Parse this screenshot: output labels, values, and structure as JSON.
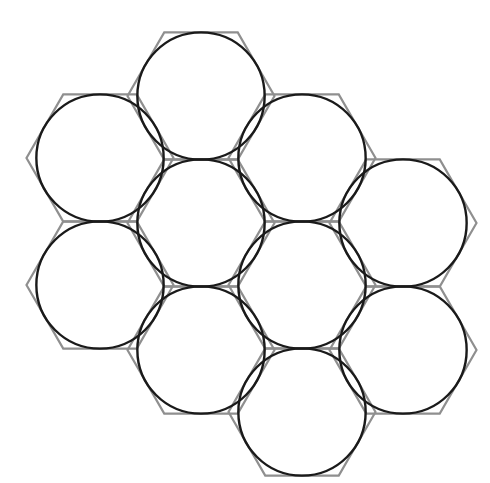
{
  "figure": {
    "background_color": "#ffffff",
    "canvas": {
      "width": 490,
      "height": 483
    },
    "hexagon": {
      "orientation": "flat-top",
      "stroke_color": "#8f8f8f",
      "stroke_width": 2.2,
      "fill": "none",
      "circumradius": 73.5,
      "inradius": 63.65,
      "width_vertex_to_vertex": 147,
      "height_flat_to_flat": 127.3,
      "count": 9
    },
    "circle": {
      "stroke_color": "#1a1a1a",
      "stroke_width": 2.4,
      "fill": "none",
      "radius": 63.65,
      "count": 9,
      "relationship": "inscribed in hexagon (tangent to all six edges)"
    },
    "lattice": {
      "horizontal_pitch": 110.25,
      "vertical_pitch": 127.3,
      "columns": 4,
      "arrangement": "2-3-3-1 columns, honeycomb cluster"
    },
    "cells": [
      {
        "id": "hex-1",
        "label": "top-center",
        "cx": 201,
        "cy": 96,
        "column": 2,
        "row": 0
      },
      {
        "id": "hex-2",
        "label": "upper-left",
        "cx": 100,
        "cy": 158,
        "column": 1,
        "row": 0
      },
      {
        "id": "hex-3",
        "label": "upper-right",
        "cx": 302,
        "cy": 158,
        "column": 3,
        "row": 0
      },
      {
        "id": "hex-4",
        "label": "middle-left",
        "cx": 100,
        "cy": 285,
        "column": 1,
        "row": 1
      },
      {
        "id": "hex-5",
        "label": "middle-inner-left",
        "cx": 201,
        "cy": 223,
        "column": 2,
        "row": 1
      },
      {
        "id": "hex-6",
        "label": "middle-center",
        "cx": 302,
        "cy": 285,
        "column": 3,
        "row": 1
      },
      {
        "id": "hex-7",
        "label": "right",
        "cx": 403,
        "cy": 223,
        "column": 4,
        "row": 0
      },
      {
        "id": "hex-8",
        "label": "lower-inner-left",
        "cx": 201,
        "cy": 350,
        "column": 2,
        "row": 2
      },
      {
        "id": "hex-9",
        "label": "lower-right",
        "cx": 403,
        "cy": 350,
        "column": 4,
        "row": 1
      },
      {
        "id": "hex-10",
        "label": "bottom-center",
        "cx": 302,
        "cy": 412,
        "column": 3,
        "row": 2
      }
    ]
  }
}
